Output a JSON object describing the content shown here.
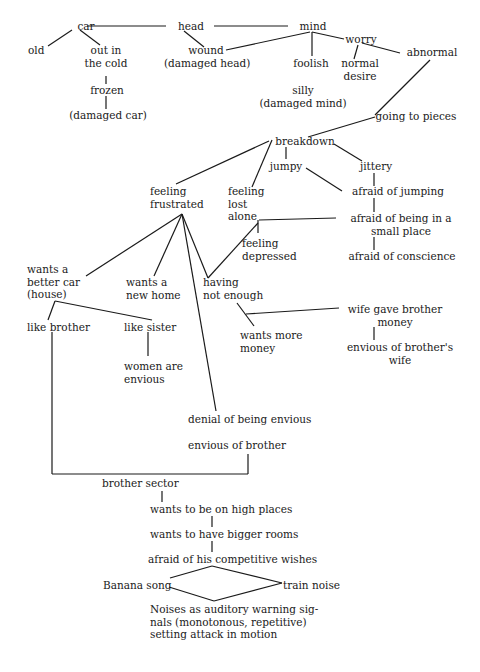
{
  "diagram": {
    "nodes": [
      {
        "id": "car",
        "text": "car",
        "x": 66,
        "y": 20,
        "w": 40,
        "align": "c"
      },
      {
        "id": "head",
        "text": "head",
        "x": 168,
        "y": 20,
        "w": 46,
        "align": "c"
      },
      {
        "id": "mind",
        "text": "mind",
        "x": 290,
        "y": 20,
        "w": 46,
        "align": "c"
      },
      {
        "id": "old",
        "text": "old",
        "x": 28,
        "y": 44,
        "w": 26,
        "align": "l"
      },
      {
        "id": "out-in-the-cold",
        "text": "out in\nthe cold",
        "x": 80,
        "y": 44,
        "w": 52,
        "align": "c"
      },
      {
        "id": "wound",
        "text": "wound\n(damaged head)",
        "x": 164,
        "y": 44,
        "w": 84,
        "align": "c"
      },
      {
        "id": "foolish",
        "text": "foolish",
        "x": 286,
        "y": 57,
        "w": 50,
        "align": "c"
      },
      {
        "id": "worry",
        "text": "worry",
        "x": 342,
        "y": 33,
        "w": 38,
        "align": "c"
      },
      {
        "id": "normal-desire",
        "text": "normal\ndesire",
        "x": 336,
        "y": 57,
        "w": 48,
        "align": "c"
      },
      {
        "id": "abnormal",
        "text": "abnormal",
        "x": 402,
        "y": 46,
        "w": 60,
        "align": "c"
      },
      {
        "id": "frozen",
        "text": "frozen",
        "x": 84,
        "y": 84,
        "w": 46,
        "align": "c"
      },
      {
        "id": "damaged-car",
        "text": "(damaged car)",
        "x": 66,
        "y": 109,
        "w": 84,
        "align": "c"
      },
      {
        "id": "silly",
        "text": "silly\n(damaged mind)",
        "x": 258,
        "y": 84,
        "w": 90,
        "align": "c"
      },
      {
        "id": "going-to-pieces",
        "text": "going to pieces",
        "x": 366,
        "y": 110,
        "w": 100,
        "align": "c"
      },
      {
        "id": "breakdown",
        "text": "breakdown",
        "x": 270,
        "y": 135,
        "w": 70,
        "align": "c"
      },
      {
        "id": "jumpy",
        "text": "jumpy",
        "x": 266,
        "y": 160,
        "w": 40,
        "align": "c"
      },
      {
        "id": "jittery",
        "text": "jittery",
        "x": 354,
        "y": 160,
        "w": 44,
        "align": "c"
      },
      {
        "id": "feeling-frustrated",
        "text": "feeling\nfrustrated",
        "x": 150,
        "y": 185,
        "w": 62,
        "align": "l"
      },
      {
        "id": "feeling-lost-alone",
        "text": "feeling\nlost\nalone",
        "x": 228,
        "y": 185,
        "w": 50,
        "align": "l"
      },
      {
        "id": "afraid-of-jumping",
        "text": "afraid of jumping",
        "x": 342,
        "y": 185,
        "w": 112,
        "align": "c"
      },
      {
        "id": "afraid-small-place",
        "text": "afraid of being in a\nsmall place",
        "x": 338,
        "y": 212,
        "w": 126,
        "align": "c"
      },
      {
        "id": "feeling-depressed",
        "text": "feeling\ndepressed",
        "x": 242,
        "y": 237,
        "w": 62,
        "align": "l"
      },
      {
        "id": "afraid-of-conscience",
        "text": "afraid of conscience",
        "x": 340,
        "y": 250,
        "w": 124,
        "align": "c"
      },
      {
        "id": "wants-better-car",
        "text": "wants a\nbetter car\n(house)",
        "x": 27,
        "y": 263,
        "w": 64,
        "align": "l"
      },
      {
        "id": "wants-new-home",
        "text": "wants a\nnew home",
        "x": 126,
        "y": 276,
        "w": 60,
        "align": "l"
      },
      {
        "id": "having-not-enough",
        "text": "having\nnot enough",
        "x": 203,
        "y": 276,
        "w": 70,
        "align": "l"
      },
      {
        "id": "wife-gave-brother-money",
        "text": "wife gave brother\nmoney",
        "x": 340,
        "y": 303,
        "w": 110,
        "align": "c"
      },
      {
        "id": "like-brother",
        "text": "like brother",
        "x": 27,
        "y": 321,
        "w": 70,
        "align": "l"
      },
      {
        "id": "like-sister",
        "text": "like sister",
        "x": 124,
        "y": 321,
        "w": 60,
        "align": "l"
      },
      {
        "id": "wants-more-money",
        "text": "wants more\nmoney",
        "x": 240,
        "y": 329,
        "w": 66,
        "align": "l"
      },
      {
        "id": "envious-of-brothers-wife",
        "text": "envious of brother's\nwife",
        "x": 340,
        "y": 341,
        "w": 120,
        "align": "c"
      },
      {
        "id": "women-are-envious",
        "text": "women are\nenvious",
        "x": 124,
        "y": 360,
        "w": 64,
        "align": "l"
      },
      {
        "id": "denial-of-being-envious",
        "text": "denial of being envious",
        "x": 188,
        "y": 413,
        "w": 140,
        "align": "l"
      },
      {
        "id": "envious-of-brother",
        "text": "envious of brother",
        "x": 188,
        "y": 439,
        "w": 110,
        "align": "l"
      },
      {
        "id": "brother-sector",
        "text": "brother sector",
        "x": 102,
        "y": 477,
        "w": 86,
        "align": "l"
      },
      {
        "id": "wants-high-places",
        "text": "wants to be on high places",
        "x": 150,
        "y": 503,
        "w": 160,
        "align": "l"
      },
      {
        "id": "wants-bigger-rooms",
        "text": "wants to have bigger rooms",
        "x": 150,
        "y": 528,
        "w": 160,
        "align": "l"
      },
      {
        "id": "afraid-competitive-wishes",
        "text": "afraid of his competitive wishes",
        "x": 148,
        "y": 553,
        "w": 190,
        "align": "l"
      },
      {
        "id": "banana-song",
        "text": "Banana song",
        "x": 103,
        "y": 579,
        "w": 72,
        "align": "l"
      },
      {
        "id": "train-noise",
        "text": "train noise",
        "x": 283,
        "y": 579,
        "w": 70,
        "align": "l"
      },
      {
        "id": "noises-warning",
        "text": "Noises as auditory warning sig-\nnals (monotonous, repetitive)\nsetting attack in motion",
        "x": 150,
        "y": 603,
        "w": 190,
        "align": "l"
      }
    ],
    "edges": [
      [
        87,
        26,
        166,
        26
      ],
      [
        214,
        26,
        288,
        26
      ],
      [
        72,
        30,
        48,
        46
      ],
      [
        80,
        30,
        100,
        45
      ],
      [
        184,
        31,
        204,
        47
      ],
      [
        226,
        50,
        310,
        32
      ],
      [
        312,
        32,
        312,
        56
      ],
      [
        312,
        32,
        344,
        39
      ],
      [
        358,
        45,
        354,
        59
      ],
      [
        362,
        43,
        400,
        53
      ],
      [
        106,
        76,
        106,
        84
      ],
      [
        106,
        96,
        106,
        109
      ],
      [
        430,
        60,
        375,
        115
      ],
      [
        375,
        117,
        308,
        137
      ],
      [
        269,
        141,
        176,
        184
      ],
      [
        272,
        140,
        252,
        187
      ],
      [
        286,
        147,
        286,
        159
      ],
      [
        334,
        144,
        362,
        161
      ],
      [
        306,
        168,
        342,
        191
      ],
      [
        374,
        173,
        374,
        186
      ],
      [
        374,
        198,
        374,
        212
      ],
      [
        374,
        237,
        374,
        250
      ],
      [
        259,
        220,
        336,
        218
      ],
      [
        258,
        220,
        258,
        233
      ],
      [
        182,
        214,
        86,
        276
      ],
      [
        182,
        214,
        154,
        276
      ],
      [
        182,
        214,
        208,
        278
      ],
      [
        208,
        278,
        258,
        223
      ],
      [
        182,
        214,
        216,
        411
      ],
      [
        55,
        301,
        48,
        320
      ],
      [
        55,
        301,
        152,
        320
      ],
      [
        148,
        332,
        148,
        356
      ],
      [
        237,
        303,
        254,
        326
      ],
      [
        246,
        314,
        339,
        308
      ],
      [
        374,
        327,
        374,
        340
      ],
      [
        52,
        332,
        52,
        474
      ],
      [
        52,
        474,
        248,
        474
      ],
      [
        248,
        474,
        248,
        454
      ],
      [
        162,
        491,
        162,
        502
      ],
      [
        212,
        516,
        212,
        527
      ],
      [
        212,
        541,
        212,
        552
      ],
      [
        212,
        566,
        170,
        578
      ],
      [
        212,
        566,
        282,
        583
      ],
      [
        169,
        587,
        214,
        601
      ],
      [
        214,
        601,
        282,
        583
      ]
    ]
  }
}
